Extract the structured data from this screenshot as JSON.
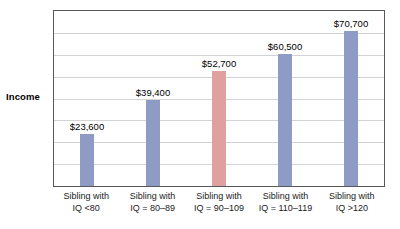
{
  "chart_data": {
    "type": "bar",
    "title": "",
    "xlabel": "",
    "ylabel": "Income",
    "ylim": [
      0,
      80000
    ],
    "grid": true,
    "legend": "none",
    "gridline_count": 8,
    "categories": [
      "Sibling with IQ <80",
      "Sibling with IQ = 80–89",
      "Sibling with IQ = 90–109",
      "Sibling with IQ = 110–119",
      "Sibling with IQ >120"
    ],
    "category_lines": [
      {
        "line1": "Sibling with",
        "line2": "IQ <80"
      },
      {
        "line1": "Sibling with",
        "line2": "IQ = 80–89"
      },
      {
        "line1": "Sibling with",
        "line2": "IQ = 90–109"
      },
      {
        "line1": "Sibling with",
        "line2": "IQ = 110–119"
      },
      {
        "line1": "Sibling with",
        "line2": "IQ >120"
      }
    ],
    "values": [
      23600,
      39400,
      52700,
      60500,
      70700
    ],
    "value_labels": [
      "$23,600",
      "$39,400",
      "$52,700",
      "$60,500",
      "$70,700"
    ],
    "bar_colors": [
      "#8e9bc4",
      "#8e9bc4",
      "#e0a0a0",
      "#8e9bc4",
      "#8e9bc4"
    ],
    "highlight_index": 2,
    "colors": {
      "bar_blue": "#8e9bc4",
      "bar_red": "#e0a0a0",
      "gridline": "#d3d3d6",
      "frame": "#58585c",
      "background": "#ffffff",
      "text": "#1a1a1a"
    }
  }
}
